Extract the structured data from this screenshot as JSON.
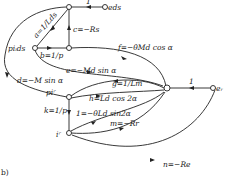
{
  "figure_label": "b)",
  "nodes": {
    "e_ds": "e_ds",
    "p_ids": "p i_ds",
    "p_ir": "p i^r",
    "i_r": "i^r",
    "e_r": "e_r"
  },
  "edges": {
    "one": "1",
    "a": "a=1/L_ds",
    "b": "b=1/p",
    "c": "c=−R_s",
    "d": "d=−M sin α",
    "e": "e=−M_d sin α",
    "f": "f=−θ̇M_d cos α",
    "g": "g=1/L_m",
    "h": "h=L_d cos 2α",
    "k": "k=1/p",
    "l": "1=−θ̇L_d sin2α",
    "m": "m=−R_r",
    "n": "n=−R_e",
    "one_r": "1"
  },
  "labels_display": {
    "e_ds": "eds",
    "p_ids": "piᵢds",
    "p_ir": "piʳ",
    "i_r": "iʳ",
    "e_r": "eᵣ",
    "a": "a=1/Lds",
    "b": "b=1/p",
    "c": "c=−Rs",
    "d": "d=−M sin α",
    "e": "e=−Md sin α",
    "f": "f=−θ̇Md cos α",
    "g": "g=1/Lm",
    "h": "h=Ld cos 2α",
    "k": "k=1/p",
    "l": "1=−θ̇Ld sin2α",
    "m": "m=−Rr",
    "n": "n=−Re",
    "one": "1",
    "one_r": "1"
  }
}
